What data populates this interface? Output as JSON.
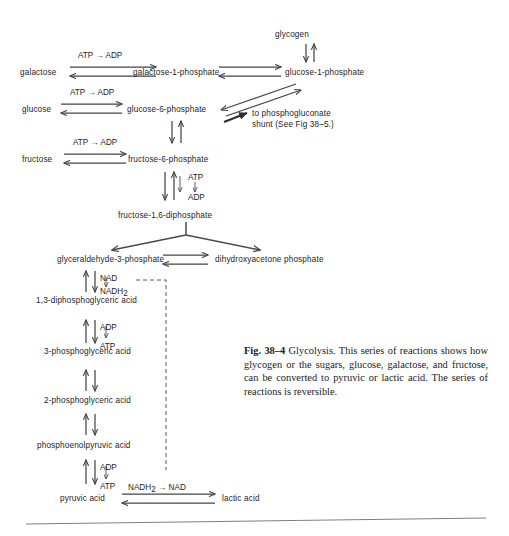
{
  "figure": {
    "caption_label": "Fig. 38–4",
    "caption_text": "Glycolysis.  This series of reactions shows how glycogen or the sugars, glucose, galactose, and fructose, can be converted to pyruvic or lactic acid.  The series of reactions is reversible.",
    "background_color": "#ffffff",
    "ink_color": "#1d1d1d",
    "arrow_color": "#454545"
  },
  "metabolites": {
    "glycogen": "glycogen",
    "galactose": "galactose",
    "galactose_1_phosphate": "galactose-1-phosphate",
    "glucose_1_phosphate": "glucose-1-phosphate",
    "glucose": "glucose",
    "glucose_6_phosphate": "glucose-6-phosphate",
    "fructose": "fructose",
    "fructose_6_phosphate": "fructose-6-phosphate",
    "fructose_16_diphosphate": "fructose-1,6-diphosphate",
    "glyceraldehyde_3_phosphate": "glyceraldehyde-3-phosphate",
    "dihydroxyacetone_phosphate": "dihydroxyacetone phosphate",
    "diphosphoglyceric_acid": "1,3-diphosphoglyceric acid",
    "phosphoglyceric_acid_3": "3-phosphoglyceric acid",
    "phosphoglyceric_acid_2": "2-phosphoglyceric acid",
    "phosphoenolpyruvic_acid": "phosphoenolpyruvic acid",
    "pyruvic_acid": "pyruvic acid",
    "lactic_acid": "lactic acid"
  },
  "cofactors": {
    "atp_to_adp_1": "ATP → ADP",
    "atp_to_adp_2": "ATP → ADP",
    "atp_to_adp_3": "ATP → ADP",
    "atp": "ATP",
    "adp": "ADP",
    "nad": "NAD",
    "nadh2_main": "NADH",
    "nadh2_sub": "2",
    "adp_2": "ADP",
    "atp_2": "ATP",
    "adp_3": "ADP",
    "atp_3": "ATP",
    "nadh2_to_nad_main": "NADH",
    "nadh2_to_nad_sub": "2",
    "nadh2_to_nad_tail": " → NAD"
  },
  "annotations": {
    "shunt_line1": "to phosphogluconate",
    "shunt_line2": "shunt (See Fig 38–5.)"
  }
}
